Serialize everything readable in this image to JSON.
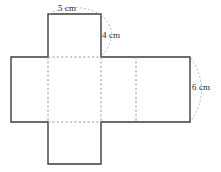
{
  "figure": {
    "name": "rectangular-prism-net",
    "background_color": "#ffffff",
    "solid_line_color": "#3d3d3d",
    "dashed_line_color": "#9a9a9a",
    "arc_color": "#b0b0b0",
    "text_color": "#2b2b2b"
  },
  "labels": {
    "top_edge": "5 cm",
    "slant_edge": "4 cm",
    "right_edge": "6 cm"
  },
  "measurements": [
    {
      "id": "top-edge",
      "value": 5,
      "unit": "cm",
      "text": "5 cm"
    },
    {
      "id": "slant-edge",
      "value": 4,
      "unit": "cm",
      "text": "4 cm"
    },
    {
      "id": "right-edge",
      "value": 6,
      "unit": "cm",
      "text": "6 cm"
    }
  ],
  "geometry": {
    "band": {
      "left": 11,
      "right": 190,
      "top": 57,
      "bottom": 122
    },
    "fold_lines_vertical_x": [
      48,
      101,
      136
    ],
    "top_flap": {
      "left": 48,
      "right": 101,
      "top": 14,
      "bottom": 57
    },
    "bottom_flap": {
      "left": 48,
      "right": 101,
      "top": 122,
      "bottom": 164
    }
  }
}
